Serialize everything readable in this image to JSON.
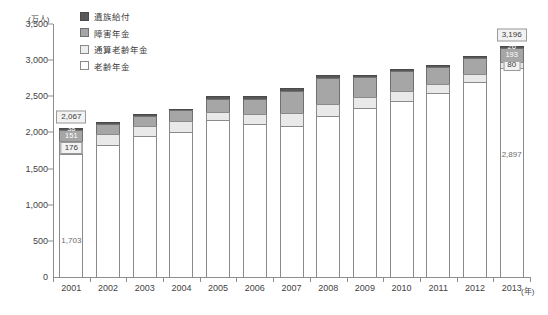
{
  "chart_data": {
    "type": "bar",
    "title": "",
    "subtitle": "",
    "xlabel": "(年)",
    "ylabel": "(万人)",
    "ylim": [
      0,
      3500
    ],
    "ytick_step": 500,
    "ytick_labels": [
      "3,500",
      "3,000",
      "2,500",
      "2,000",
      "1,500",
      "1,000",
      "500",
      "0"
    ],
    "ytick_values": [
      3500,
      3000,
      2500,
      2000,
      1500,
      1000,
      500,
      0
    ],
    "grid": false,
    "stacked": true,
    "legend_position": "top-left",
    "categories": [
      "2001",
      "2002",
      "2003",
      "2004",
      "2005",
      "2006",
      "2007",
      "2008",
      "2009",
      "2010",
      "2011",
      "2012",
      "2013"
    ],
    "series": [
      {
        "name": "老齢年金",
        "color": "#ffffff",
        "values": [
          1703,
          1830,
          1945,
          2000,
          2175,
          2110,
          2090,
          2225,
          2340,
          2430,
          2540,
          2700,
          2897
        ]
      },
      {
        "name": "通算老齢年金",
        "color": "#e9e9e9",
        "values": [
          176,
          155,
          148,
          152,
          110,
          140,
          180,
          170,
          155,
          145,
          130,
          105,
          80
        ]
      },
      {
        "name": "障害年金",
        "color": "#a6a6a6",
        "values": [
          151,
          132,
          128,
          152,
          181,
          216,
          310,
          360,
          270,
          270,
          235,
          225,
          193
        ]
      },
      {
        "name": "遺族給付",
        "color": "#585858",
        "values": [
          38,
          33,
          29,
          26,
          34,
          34,
          40,
          45,
          35,
          35,
          35,
          30,
          26
        ]
      }
    ],
    "totals": [
      2067,
      2150,
      2250,
      2330,
      2500,
      2500,
      2620,
      2800,
      2800,
      2880,
      2940,
      3060,
      3196
    ],
    "annotations": [
      {
        "category": "2001",
        "label": "2,067",
        "kind": "total-callout"
      },
      {
        "category": "2001",
        "label": "38",
        "kind": "segment",
        "series": "遺族給付"
      },
      {
        "category": "2001",
        "label": "151",
        "kind": "segment",
        "series": "障害年金"
      },
      {
        "category": "2001",
        "label": "176",
        "kind": "segment",
        "series": "通算老齢年金"
      },
      {
        "category": "2001",
        "label": "1,703",
        "kind": "segment",
        "series": "老齢年金"
      },
      {
        "category": "2013",
        "label": "3,196",
        "kind": "total-callout"
      },
      {
        "category": "2013",
        "label": "26",
        "kind": "segment",
        "series": "遺族給付"
      },
      {
        "category": "2013",
        "label": "193",
        "kind": "segment",
        "series": "障害年金"
      },
      {
        "category": "2013",
        "label": "80",
        "kind": "segment",
        "series": "通算老齢年金"
      },
      {
        "category": "2013",
        "label": "2,897",
        "kind": "segment",
        "series": "老齢年金"
      }
    ]
  },
  "legend": {
    "items": [
      {
        "label": "遺族給付",
        "swatch": "k3"
      },
      {
        "label": "障害年金",
        "swatch": "k2"
      },
      {
        "label": "通算老齢年金",
        "swatch": "k1"
      },
      {
        "label": "老齢年金",
        "swatch": "k0"
      }
    ]
  }
}
